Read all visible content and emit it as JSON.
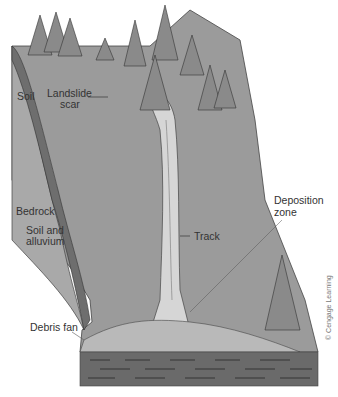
{
  "diagram": {
    "labels": {
      "soil": "Soil",
      "landslide_scar": "Landslide\nscar",
      "landslide_scar_line1": "Landslide",
      "landslide_scar_line2": "scar",
      "bedrock": "Bedrock",
      "soil_alluvium_line1": "Soil and",
      "soil_alluvium_line2": "alluvium",
      "track": "Track",
      "deposition_line1": "Deposition",
      "deposition_line2": "zone",
      "debris_fan": "Debris fan"
    },
    "credit": "© Cengage Learning",
    "colors": {
      "slope": "#9a9a9a",
      "slope_face": "#8c8c8c",
      "soil_band": "#6e6e6e",
      "bedrock": "#a8a8a8",
      "track": "#d9d9d9",
      "base_layer": "#6a6a6a",
      "tree": "#8a8a8a"
    }
  }
}
